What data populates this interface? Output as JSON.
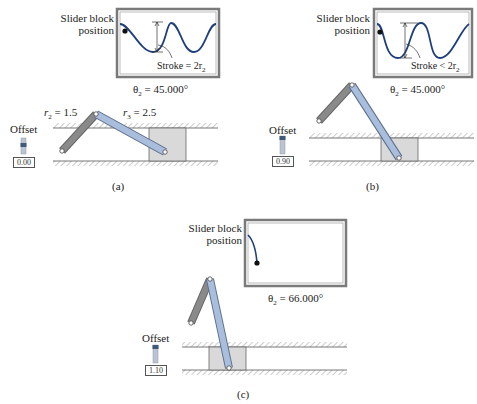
{
  "panels": [
    {
      "id": "a",
      "caption": "(a)",
      "plot_label_line1": "Slider block",
      "plot_label_line2": "position",
      "stroke_label": "Stroke = 2r",
      "stroke_sub": "2",
      "theta_label": "θ",
      "theta_sub": "2",
      "theta_value": " = 45.000°",
      "offset_label": "Offset",
      "offset_value": "0.00",
      "r2_label": "r",
      "r2_sub": "2",
      "r2_value": " = 1.5",
      "r3_label": "r",
      "r3_sub": "3",
      "r3_value": " = 2.5"
    },
    {
      "id": "b",
      "caption": "(b)",
      "plot_label_line1": "Slider block",
      "plot_label_line2": "position",
      "stroke_label": "Stroke < 2r",
      "stroke_sub": "2",
      "theta_label": "θ",
      "theta_sub": "2",
      "theta_value": " = 45.000°",
      "offset_label": "Offset",
      "offset_value": "0.90"
    },
    {
      "id": "c",
      "caption": "(c)",
      "plot_label_line1": "Slider block",
      "plot_label_line2": "position",
      "theta_label": "θ",
      "theta_sub": "2",
      "theta_value": " = 66.000°",
      "offset_label": "Offset",
      "offset_value": "1.10"
    }
  ],
  "colors": {
    "crank": "#8a8a8a",
    "coupler": "#a9bedc",
    "block": "#d9d9d9",
    "curve": "#1f3f7a",
    "frame": "#7a7a7a"
  }
}
